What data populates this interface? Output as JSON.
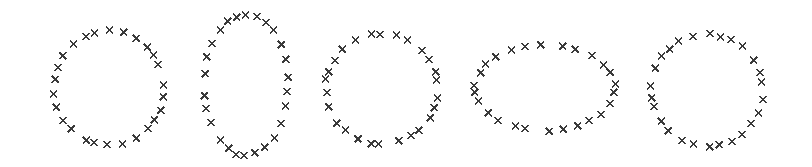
{
  "figure": {
    "background_color": "#ffffff",
    "marker_color": "#3a3a3a",
    "marker_symbol": "x",
    "marker_size_px": 7,
    "marker_stroke_width": 1.6,
    "width": 812,
    "height": 167
  },
  "chart_data": {
    "type": "scatter",
    "title": "",
    "subtitle": "",
    "xlabel": "",
    "ylabel": "",
    "grid": false,
    "legend": null,
    "axes_visible": false,
    "tick_labels": [],
    "annotations": [],
    "xlim": [
      0,
      812
    ],
    "ylim": [
      0,
      167
    ],
    "y_axis_inverted": true,
    "marker": "x",
    "series": [
      {
        "name": "shape-1-circle",
        "shape": "circle",
        "center": [
          109,
          88
        ],
        "rx": 55,
        "ry": 57,
        "n_points": 26,
        "start_angle_deg": -90,
        "jitter_seed": 1
      },
      {
        "name": "shape-2-tall-ellipse",
        "shape": "ellipse-vertical",
        "center": [
          246,
          85
        ],
        "rx": 42,
        "ry": 71,
        "n_points": 26,
        "start_angle_deg": -90,
        "jitter_seed": 2
      },
      {
        "name": "shape-3-circle",
        "shape": "circle",
        "center": [
          382,
          89
        ],
        "rx": 56,
        "ry": 55,
        "n_points": 26,
        "start_angle_deg": -90,
        "jitter_seed": 3
      },
      {
        "name": "shape-4-wide-ellipse",
        "shape": "ellipse-horizontal",
        "center": [
          545,
          88
        ],
        "rx": 70,
        "ry": 43,
        "n_points": 26,
        "start_angle_deg": -90,
        "jitter_seed": 4
      },
      {
        "name": "shape-5-circle",
        "shape": "circle",
        "center": [
          707,
          90
        ],
        "rx": 56,
        "ry": 56,
        "n_points": 26,
        "start_angle_deg": -90,
        "jitter_seed": 5
      }
    ]
  }
}
